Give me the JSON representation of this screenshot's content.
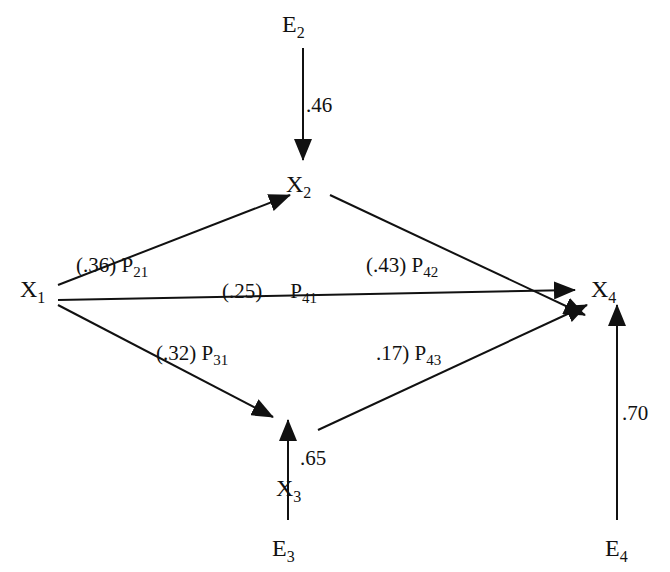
{
  "diagram": {
    "type": "path-diagram",
    "nodes": {
      "x1": {
        "label": "X",
        "sub": "1"
      },
      "x2": {
        "label": "X",
        "sub": "2"
      },
      "x3": {
        "label": "X",
        "sub": "3"
      },
      "x4": {
        "label": "X",
        "sub": "4"
      },
      "e2": {
        "label": "E",
        "sub": "2"
      },
      "e3": {
        "label": "E",
        "sub": "3"
      },
      "e4": {
        "label": "E",
        "sub": "4"
      }
    },
    "edges": {
      "p21": {
        "from": "X1",
        "to": "X2",
        "coef": "(.36) P",
        "sub": "21"
      },
      "p42": {
        "from": "X2",
        "to": "X4",
        "coef": "(.43) P",
        "sub": "42"
      },
      "p41": {
        "from": "X1",
        "to": "X4",
        "coef": "(.25)",
        "p": "P",
        "sub": "41"
      },
      "p31": {
        "from": "X1",
        "to": "X3",
        "coef": "(.32) P",
        "sub": "31"
      },
      "p43": {
        "from": "X3",
        "to": "X4",
        "coef": ".17) P",
        "sub": "43"
      },
      "e2x2": {
        "from": "E2",
        "to": "X2",
        "coef": ".46"
      },
      "e3x3": {
        "from": "E3",
        "to": "X3",
        "coef": ".65"
      },
      "e4x4": {
        "from": "E4",
        "to": "X4",
        "coef": ".70"
      }
    }
  }
}
